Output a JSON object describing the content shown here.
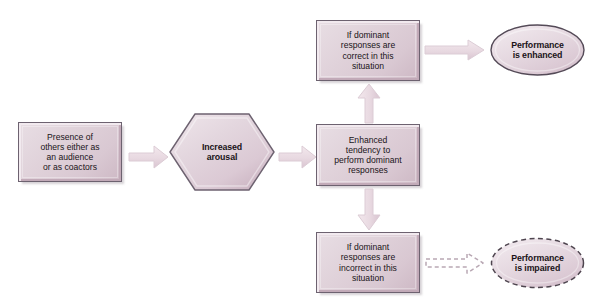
{
  "diagram": {
    "title_sliver": "",
    "colors": {
      "shape_fill_light": "#e8dee4",
      "shape_fill_dark": "#cdb8c4",
      "shape_border": "#6d6270",
      "arrow_fill": "#ecdfe4",
      "arrow_border": "#d8c6cf",
      "text": "#1a1418",
      "background": "#ffffff"
    },
    "nodes": [
      {
        "id": "presence",
        "shape": "rectangle",
        "text": "Presence of others either as an audience or as coactors",
        "lines": [
          "Presence of",
          "others either as",
          "an audience",
          "or as coactors"
        ],
        "bold": false
      },
      {
        "id": "arousal",
        "shape": "hexagon",
        "text": "Increased arousal",
        "lines": [
          "Increased",
          "arousal"
        ],
        "bold": true
      },
      {
        "id": "tendency",
        "shape": "rectangle",
        "text": "Enhanced tendency to perform dominant responses",
        "lines": [
          "Enhanced",
          "tendency to",
          "perform dominant",
          "responses"
        ],
        "bold": false
      },
      {
        "id": "correct",
        "shape": "rectangle",
        "text": "If dominant responses are correct in this situation",
        "lines": [
          "If dominant",
          "responses are",
          "correct in this",
          "situation"
        ],
        "bold": false
      },
      {
        "id": "incorrect",
        "shape": "rectangle",
        "text": "If dominant responses are incorrect in this situation",
        "lines": [
          "If dominant",
          "responses are",
          "incorrect in this",
          "situation"
        ],
        "bold": false
      },
      {
        "id": "enhanced",
        "shape": "oval",
        "border_style": "solid",
        "text": "Performance is enhanced",
        "lines": [
          "Performance",
          "is enhanced"
        ],
        "bold": true
      },
      {
        "id": "impaired",
        "shape": "oval",
        "border_style": "dashed",
        "text": "Performance is impaired",
        "lines": [
          "Performance",
          "is impaired"
        ],
        "bold": true
      }
    ],
    "edges": [
      {
        "id": "presence-to-arousal",
        "from": "presence",
        "to": "arousal",
        "direction": "right",
        "style": "solid"
      },
      {
        "id": "arousal-to-tendency",
        "from": "arousal",
        "to": "tendency",
        "direction": "right",
        "style": "solid"
      },
      {
        "id": "tendency-to-correct",
        "from": "tendency",
        "to": "correct",
        "direction": "up",
        "style": "solid"
      },
      {
        "id": "tendency-to-incorrect",
        "from": "tendency",
        "to": "incorrect",
        "direction": "down",
        "style": "solid"
      },
      {
        "id": "correct-to-enhanced",
        "from": "correct",
        "to": "enhanced",
        "direction": "right",
        "style": "solid"
      },
      {
        "id": "incorrect-to-impaired",
        "from": "incorrect",
        "to": "impaired",
        "direction": "right",
        "style": "dashed"
      }
    ]
  }
}
